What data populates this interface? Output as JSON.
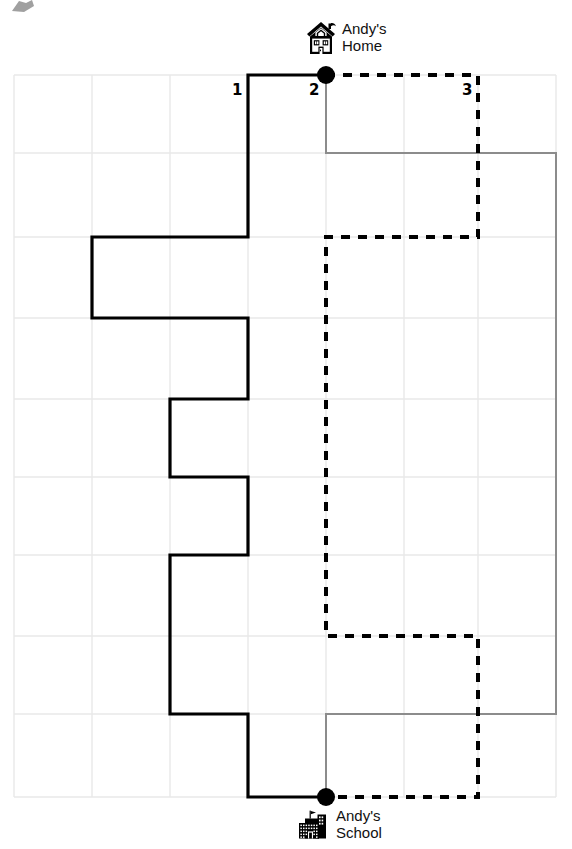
{
  "figure": {
    "type": "grid-route-diagram",
    "width": 572,
    "height": 849,
    "background_color": "#ffffff"
  },
  "grid": {
    "line_color": "#e8e8e8",
    "cell_size": 78,
    "x_lines": [
      14,
      92,
      170,
      248,
      326,
      404,
      478,
      556
    ],
    "y_lines": [
      75,
      153,
      237,
      318,
      399,
      477,
      555,
      636,
      714,
      797
    ],
    "columns": 7,
    "rows": 9
  },
  "labels": [
    {
      "id": "label-1",
      "text": "1",
      "x": 232,
      "y": 83,
      "color": "#000000"
    },
    {
      "id": "label-2",
      "text": "2",
      "x": 309,
      "y": 83,
      "color": "#000000"
    },
    {
      "id": "label-3",
      "text": "3",
      "x": 462,
      "y": 83,
      "color": "#000000"
    }
  ],
  "places": [
    {
      "id": "home",
      "icon": "house-icon",
      "label": "Andy's\nHome",
      "marker_x": 326,
      "marker_y": 75
    },
    {
      "id": "school",
      "icon": "school-icon",
      "label": "Andy's\nSchool",
      "marker_x": 326,
      "marker_y": 797
    }
  ],
  "routes": [
    {
      "id": "solid-route",
      "style": "solid",
      "color": "#000000",
      "width": 3.2,
      "points": "326,75 248,75 248,237 92,237 92,318 248,318 248,399 170,399 170,477 248,477 248,555 170,555 170,714 248,714 248,797 326,797"
    },
    {
      "id": "gray-route",
      "style": "solid",
      "color": "#8c8c8c",
      "width": 2,
      "points": "326,75 326,153 556,153 556,714 326,714 326,797"
    },
    {
      "id": "dashed-route",
      "style": "dashed",
      "color": "#000000",
      "width": 4,
      "dash": "9 8",
      "points": "326,75 478,75 478,237 326,237 326,636 478,636 478,797 326,797"
    }
  ],
  "markers": {
    "color": "#000000",
    "radius": 9
  },
  "colors": {
    "grid": "#e8e8e8",
    "solid_path": "#000000",
    "gray_path": "#8c8c8c",
    "dashed_path": "#000000",
    "text": "#111111"
  }
}
